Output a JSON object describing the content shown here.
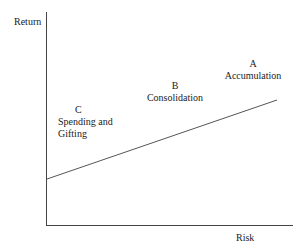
{
  "diagram": {
    "y_axis_label": "Return",
    "x_axis_label": "Risk",
    "line": {
      "from": [
        46,
        179
      ],
      "to": [
        277,
        100
      ],
      "color": "#555555"
    },
    "axis_color": "#444444",
    "phases": [
      {
        "letter": "A",
        "name": "Accumulation"
      },
      {
        "letter": "B",
        "name": "Consolidation"
      },
      {
        "letter": "C",
        "name_line1": "Spending and",
        "name_line2": "Gifting"
      }
    ]
  }
}
